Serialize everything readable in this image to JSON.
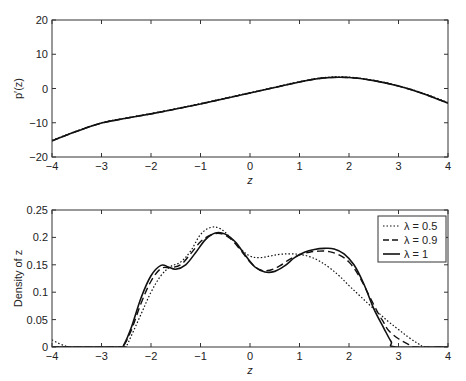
{
  "chart_data": [
    {
      "type": "line",
      "title": "",
      "xlabel": "z",
      "ylabel": "p′(z)",
      "xlim": [
        -4,
        4
      ],
      "ylim": [
        -20,
        20
      ],
      "xticks": [
        -4,
        -3,
        -2,
        -1,
        0,
        1,
        2,
        3,
        4
      ],
      "yticks": [
        -20,
        -10,
        0,
        10,
        20
      ],
      "xtick_labels": [
        "−4",
        "−3",
        "−2",
        "−1",
        "0",
        "1",
        "2",
        "3",
        "4"
      ],
      "ytick_labels": [
        "−20",
        "−10",
        "0",
        "10",
        "20"
      ],
      "grid": false,
      "series": [
        {
          "name": "λ = 0.5",
          "style": "dotted",
          "x": [
            -4,
            -3.5,
            -3,
            -2.5,
            -2,
            -1.5,
            -1,
            -0.5,
            0,
            0.5,
            1,
            1.5,
            2,
            2.5,
            3,
            3.5,
            4
          ],
          "y": [
            -15.1,
            -12.4,
            -10.0,
            -8.6,
            -7.3,
            -5.9,
            -4.4,
            -2.8,
            -1.2,
            0.4,
            2.0,
            3.2,
            3.3,
            2.4,
            0.8,
            -1.4,
            -4.1
          ]
        },
        {
          "name": "λ = 0.9",
          "style": "dashed",
          "x": [
            -4,
            -3.5,
            -3,
            -2.5,
            -2,
            -1.5,
            -1,
            -0.5,
            0,
            0.5,
            1,
            1.5,
            2,
            2.5,
            3,
            3.5,
            4
          ],
          "y": [
            -15.3,
            -12.5,
            -10.1,
            -8.7,
            -7.4,
            -6.0,
            -4.5,
            -2.9,
            -1.3,
            0.3,
            1.9,
            3.1,
            3.2,
            2.3,
            0.7,
            -1.5,
            -4.3
          ]
        },
        {
          "name": "λ = 1",
          "style": "solid",
          "x": [
            -4,
            -3.5,
            -3,
            -2.5,
            -2,
            -1.5,
            -1,
            -0.5,
            0,
            0.5,
            1,
            1.5,
            2,
            2.5,
            3,
            3.5,
            4
          ],
          "y": [
            -15.3,
            -12.5,
            -10.1,
            -8.7,
            -7.4,
            -6.0,
            -4.5,
            -2.9,
            -1.3,
            0.3,
            1.9,
            3.1,
            3.2,
            2.3,
            0.7,
            -1.5,
            -4.3
          ]
        }
      ]
    },
    {
      "type": "line",
      "title": "",
      "xlabel": "z",
      "ylabel": "Density of z",
      "xlim": [
        -4,
        4
      ],
      "ylim": [
        0,
        0.25
      ],
      "xticks": [
        -4,
        -3,
        -2,
        -1,
        0,
        1,
        2,
        3,
        4
      ],
      "yticks": [
        0,
        0.05,
        0.1,
        0.15,
        0.2,
        0.25
      ],
      "xtick_labels": [
        "−4",
        "−3",
        "−2",
        "−1",
        "0",
        "1",
        "2",
        "3",
        "4"
      ],
      "ytick_labels": [
        "0",
        "0.05",
        "0.1",
        "0.15",
        "0.2",
        "0.25"
      ],
      "grid": false,
      "legend": {
        "position": "top-right",
        "entries": [
          {
            "label": "λ = 0.5",
            "style": "dotted"
          },
          {
            "label": "λ = 0.9",
            "style": "dashed"
          },
          {
            "label": "λ = 1",
            "style": "solid"
          }
        ]
      },
      "series": [
        {
          "name": "λ = 0.5",
          "style": "dotted",
          "x": [
            -4,
            -3.85,
            -3.7,
            -3.6,
            -2.6,
            -2.5,
            -2.4,
            -2.2,
            -2.0,
            -1.8,
            -1.6,
            -1.4,
            -1.2,
            -1.0,
            -0.8,
            -0.6,
            -0.4,
            -0.2,
            0.0,
            0.2,
            0.4,
            0.6,
            0.8,
            1.0,
            1.2,
            1.4,
            1.6,
            1.8,
            2.0,
            2.2,
            2.4,
            2.6,
            2.8,
            3.0,
            3.2,
            3.4,
            3.55,
            4.0
          ],
          "y": [
            0.013,
            0.006,
            0.001,
            0.0,
            0.0,
            0.002,
            0.02,
            0.06,
            0.1,
            0.13,
            0.147,
            0.155,
            0.175,
            0.205,
            0.218,
            0.216,
            0.2,
            0.18,
            0.166,
            0.163,
            0.166,
            0.169,
            0.17,
            0.169,
            0.165,
            0.157,
            0.145,
            0.13,
            0.112,
            0.095,
            0.078,
            0.062,
            0.046,
            0.032,
            0.018,
            0.006,
            0.0,
            0.0
          ]
        },
        {
          "name": "λ = 0.9",
          "style": "dashed",
          "x": [
            -4,
            -2.65,
            -2.55,
            -2.4,
            -2.2,
            -2.0,
            -1.8,
            -1.6,
            -1.4,
            -1.2,
            -1.0,
            -0.8,
            -0.6,
            -0.4,
            -0.2,
            0.0,
            0.2,
            0.4,
            0.6,
            0.8,
            1.0,
            1.2,
            1.4,
            1.6,
            1.8,
            2.0,
            2.2,
            2.4,
            2.6,
            2.7,
            2.8,
            3.0,
            3.2,
            3.35,
            4.0
          ],
          "y": [
            0.0,
            0.0,
            0.003,
            0.03,
            0.08,
            0.12,
            0.143,
            0.145,
            0.15,
            0.17,
            0.192,
            0.204,
            0.207,
            0.198,
            0.178,
            0.155,
            0.141,
            0.14,
            0.148,
            0.16,
            0.168,
            0.173,
            0.175,
            0.174,
            0.168,
            0.155,
            0.13,
            0.095,
            0.06,
            0.045,
            0.03,
            0.015,
            0.005,
            0.0,
            0.0
          ]
        },
        {
          "name": "λ = 1",
          "style": "solid",
          "x": [
            -4,
            -2.65,
            -2.55,
            -2.4,
            -2.2,
            -2.0,
            -1.8,
            -1.65,
            -1.5,
            -1.3,
            -1.1,
            -0.9,
            -0.7,
            -0.5,
            -0.3,
            -0.1,
            0.1,
            0.3,
            0.5,
            0.7,
            0.9,
            1.1,
            1.3,
            1.5,
            1.7,
            1.9,
            2.1,
            2.3,
            2.5,
            2.7,
            2.85,
            2.95,
            4.0
          ],
          "y": [
            0.0,
            0.0,
            0.004,
            0.035,
            0.09,
            0.13,
            0.149,
            0.146,
            0.142,
            0.15,
            0.172,
            0.196,
            0.208,
            0.206,
            0.192,
            0.168,
            0.146,
            0.137,
            0.138,
            0.148,
            0.163,
            0.173,
            0.178,
            0.18,
            0.179,
            0.17,
            0.15,
            0.115,
            0.07,
            0.035,
            0.01,
            0.0,
            0.0
          ]
        }
      ]
    }
  ]
}
